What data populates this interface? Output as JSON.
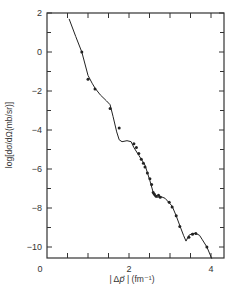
{
  "chart_data": {
    "type": "line",
    "title": "",
    "xlabel": "| Δp⃗ | (fm⁻¹)",
    "ylabel": "log[dσ/dΩ(mb/sr)]",
    "xlim": [
      0,
      4.2
    ],
    "ylim": [
      -10.9,
      2
    ],
    "x_ticks": [
      0,
      2,
      4
    ],
    "x_tick_labels": [
      "0",
      "2",
      "4"
    ],
    "x_minor_ticks": [
      0.5,
      1,
      1.5,
      2.5,
      3,
      3.5
    ],
    "y_ticks": [
      2,
      0,
      -2,
      -4,
      -6,
      -8,
      -10
    ],
    "y_tick_labels": [
      "2",
      "0",
      "−2",
      "−4",
      "−6",
      "−8",
      "−10"
    ],
    "grid": false,
    "legend": null,
    "series": [
      {
        "name": "fit curve",
        "style": "solid line",
        "x": [
          0.54,
          0.7,
          0.85,
          1.0,
          1.1,
          1.17,
          1.3,
          1.45,
          1.54,
          1.61,
          1.7,
          1.76,
          1.83,
          1.95,
          2.05,
          2.12,
          2.24,
          2.39,
          2.51,
          2.59,
          2.63,
          2.7,
          2.76,
          2.88,
          3.05,
          3.15,
          3.24,
          3.33,
          3.39,
          3.46,
          3.55,
          3.63,
          3.72,
          3.78,
          3.9,
          4.02
        ],
        "y": [
          1.7,
          0.8,
          0.0,
          -1.2,
          -1.6,
          -1.85,
          -2.2,
          -2.5,
          -2.7,
          -3.3,
          -4.1,
          -4.5,
          -4.6,
          -4.55,
          -4.6,
          -4.9,
          -5.3,
          -5.8,
          -6.6,
          -7.2,
          -7.4,
          -7.45,
          -7.4,
          -7.5,
          -7.9,
          -8.4,
          -8.9,
          -9.4,
          -9.7,
          -9.4,
          -9.3,
          -9.3,
          -9.4,
          -9.6,
          -10.0,
          -10.6
        ]
      },
      {
        "name": "data points",
        "style": "markers",
        "x": [
          0.85,
          1.0,
          1.17,
          1.54,
          1.76,
          2.12,
          2.18,
          2.24,
          2.3,
          2.35,
          2.39,
          2.45,
          2.51,
          2.55,
          2.59,
          2.62,
          2.66,
          2.72,
          2.76,
          2.98,
          3.05,
          3.15,
          3.24,
          3.46,
          3.55,
          3.63,
          3.9
        ],
        "y": [
          0.0,
          -1.4,
          -1.9,
          -2.9,
          -3.9,
          -4.7,
          -4.9,
          -5.2,
          -5.5,
          -5.7,
          -5.9,
          -6.2,
          -6.5,
          -6.8,
          -7.2,
          -7.3,
          -7.4,
          -7.35,
          -7.45,
          -7.7,
          -7.95,
          -8.4,
          -8.95,
          -9.5,
          -9.35,
          -9.3,
          -10.0
        ]
      }
    ]
  },
  "axes": {
    "xlabel_prefix": "| Δ",
    "xlabel_var": "p⃗",
    "xlabel_suffix": " | (fm⁻¹)",
    "ylabel": "log[dσ/dΩ(mb/sr)]"
  }
}
